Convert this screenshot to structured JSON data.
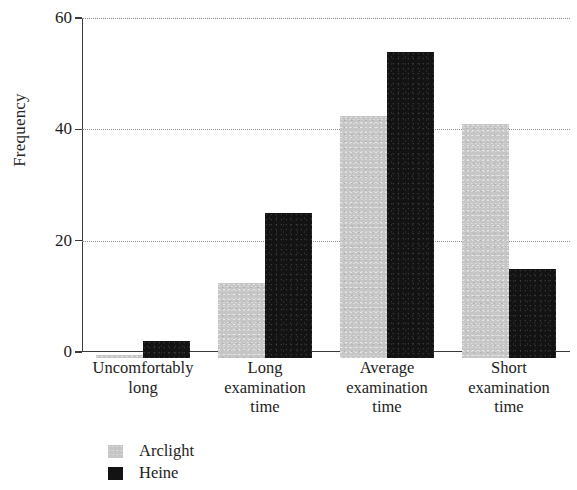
{
  "chart_data": {
    "type": "bar",
    "title": "",
    "subtitle": "",
    "xlabel": "",
    "ylabel": "Frequency",
    "categories": [
      "Uncomfortably long",
      "Long examination time",
      "Average examination time",
      "Short examination time"
    ],
    "category_lines": [
      [
        "Uncomfortably",
        "long"
      ],
      [
        "Long",
        "examination",
        "time"
      ],
      [
        "Average",
        "examination",
        "time"
      ],
      [
        "Short",
        "examination",
        "time"
      ]
    ],
    "series": [
      {
        "name": "Arclight",
        "color": "#c6c6c6",
        "values": [
          0.5,
          13.5,
          43.5,
          42
        ]
      },
      {
        "name": "Heine",
        "color": "#131313",
        "values": [
          3,
          26,
          55,
          16
        ]
      }
    ],
    "ylim": [
      0,
      60
    ],
    "yticks": [
      0,
      20,
      40,
      60
    ],
    "ytick_labels": [
      "0",
      "20",
      "40",
      "60"
    ],
    "grid": "horizontal-dotted",
    "legend_position": "bottom-left",
    "legend_entries": [
      {
        "label": "Arclight",
        "color": "#c6c6c6"
      },
      {
        "label": "Heine",
        "color": "#131313"
      }
    ],
    "axis_color": "#3a3a3a",
    "gridline_color": "#8a8a8a",
    "background_color": "#ffffff"
  }
}
